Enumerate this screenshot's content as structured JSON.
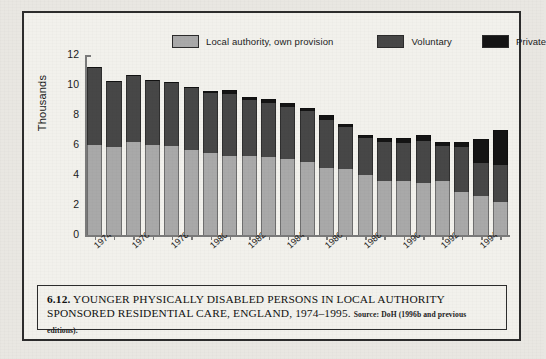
{
  "figure": {
    "caption_number": "6.12.",
    "caption_title": "YOUNGER PHYSICALLY DISABLED PERSONS IN LOCAL AUTHORITY SPONSORED RESIDENTIAL CARE, ENGLAND, 1974–1995.",
    "caption_source": "Source: DoH (1996b and previous editions).",
    "colors": {
      "local_authority": "#a9a9a9",
      "voluntary": "#474747",
      "private": "#141414",
      "plot_background": "#f2f1ec",
      "page_background": "#e9e7e2",
      "frame": "#2c2c2c",
      "axis": "#7a7a7a"
    }
  },
  "chart_data": {
    "type": "bar",
    "subtype": "stacked",
    "title": "",
    "xlabel": "",
    "ylabel": "Thousands",
    "ylim": [
      0,
      12
    ],
    "yticks": [
      0,
      2,
      4,
      6,
      8,
      10,
      12
    ],
    "ytick_labels": [
      "0",
      "2",
      "4",
      "6",
      "8",
      "10",
      "12"
    ],
    "grid": false,
    "legend_position": "top",
    "categories": [
      "1974",
      "1975",
      "1976",
      "1977",
      "1978",
      "1979",
      "1980",
      "1981",
      "1982",
      "1983",
      "1984",
      "1985",
      "1986",
      "1987",
      "1988",
      "1989",
      "1990",
      "1991",
      "1992",
      "1993",
      "1994",
      "1995"
    ],
    "xtick_labels_shown": [
      "1974",
      "1976",
      "1978",
      "1980",
      "1982",
      "1984",
      "1986",
      "1988",
      "1990",
      "1992",
      "1994"
    ],
    "series": [
      {
        "name": "Local authority, own provision",
        "color": "#a9a9a9",
        "values": [
          6.0,
          5.85,
          6.2,
          6.0,
          5.95,
          5.7,
          5.5,
          5.3,
          5.3,
          5.2,
          5.1,
          4.9,
          4.5,
          4.4,
          4.0,
          3.6,
          3.6,
          3.5,
          3.6,
          2.9,
          2.6,
          2.2
        ]
      },
      {
        "name": "Voluntary",
        "color": "#474747",
        "values": [
          5.2,
          4.45,
          4.5,
          4.35,
          4.25,
          4.1,
          3.95,
          4.1,
          3.7,
          3.6,
          3.45,
          3.4,
          3.2,
          2.8,
          2.45,
          2.6,
          2.55,
          2.8,
          2.35,
          3.0,
          2.2,
          2.45
        ]
      },
      {
        "name": "Private",
        "color": "#141414",
        "values": [
          0.0,
          0.0,
          0.0,
          0.0,
          0.0,
          0.1,
          0.15,
          0.3,
          0.2,
          0.25,
          0.25,
          0.2,
          0.3,
          0.2,
          0.2,
          0.25,
          0.3,
          0.35,
          0.25,
          0.3,
          1.6,
          2.35
        ]
      }
    ],
    "totals": [
      11.2,
      10.3,
      10.7,
      10.35,
      10.2,
      9.9,
      9.6,
      9.7,
      9.2,
      9.05,
      8.8,
      8.5,
      8.0,
      7.4,
      6.65,
      6.45,
      6.45,
      6.65,
      6.2,
      6.2,
      6.4,
      7.0
    ]
  }
}
